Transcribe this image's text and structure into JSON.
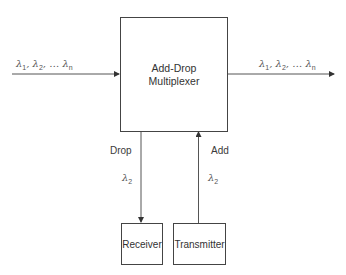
{
  "diagram": {
    "type": "block-diagram",
    "title": "Add-Drop Multiplexer",
    "main_block": {
      "line1": "Add-Drop",
      "line2": "Multiplexer"
    },
    "input_label": {
      "symbol": "λ",
      "parts": [
        "1",
        "2",
        "n"
      ]
    },
    "output_label": {
      "symbol": "λ",
      "parts": [
        "1",
        "2",
        "n"
      ]
    },
    "drop": {
      "label": "Drop",
      "wavelength_symbol": "λ",
      "wavelength_index": "2"
    },
    "add": {
      "label": "Add",
      "wavelength_symbol": "λ",
      "wavelength_index": "2"
    },
    "receiver": {
      "label": "Receiver"
    },
    "transmitter": {
      "label": "Transmitter"
    },
    "edges": [
      {
        "from": "input",
        "to": "main_block",
        "label": "λ1, λ2, … λn"
      },
      {
        "from": "main_block",
        "to": "output",
        "label": "λ1, λ2, … λn"
      },
      {
        "from": "main_block",
        "to": "receiver",
        "label": "Drop λ2"
      },
      {
        "from": "transmitter",
        "to": "main_block",
        "label": "Add λ2"
      }
    ],
    "colors": {
      "line": "#444444",
      "text": "#333333",
      "background": "#ffffff"
    }
  }
}
